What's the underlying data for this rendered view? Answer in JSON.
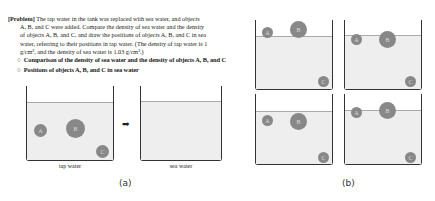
{
  "problem": {
    "tag": "[Problem]",
    "line1": " The tap water in the tank was replaced with sea water, and objects",
    "line2": "A, B, and C were added. Compare the density of sea water and the density",
    "line3": "of objects A, B, and C, and draw the positions of objects A, B, and C in sea",
    "line4": "water, referring to their positions in tap water. (The density of tap water is 1",
    "line5": "g/cm³, and the density of sea water is 1.03 g/cm³.)"
  },
  "bullets": [
    {
      "mark": "○",
      "text": "Comparison of the density of sea water and the density of objects A, B, and C"
    },
    {
      "mark": "○",
      "text": "Positions of objects A, B, and C in sea water"
    }
  ],
  "figure_a": {
    "tap_label": "tap water",
    "sea_label": "sea water",
    "arrow": "➡",
    "caption": "(a)",
    "objects": {
      "A": "A",
      "B": "B",
      "C": "C"
    }
  },
  "figure_b": {
    "caption": "(b)",
    "objects": {
      "A": "A",
      "B": "B",
      "C": "C"
    }
  }
}
